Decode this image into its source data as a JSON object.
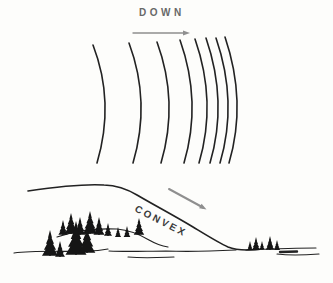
{
  "figure": {
    "top_label": "DOWN",
    "slope_label": "CONVEX"
  },
  "colors": {
    "background": "#fdfdfb",
    "ink": "#222222",
    "tree_fill": "#151515",
    "arrow_gray": "#8f8f8f",
    "down_label_color": "#686868",
    "convex_label_color": "#3a3a3a"
  },
  "drawing": {
    "contour_bottom_y": 163,
    "contours": [
      {
        "x": 93,
        "top": 45
      },
      {
        "x": 129,
        "top": 43
      },
      {
        "x": 157,
        "top": 42
      },
      {
        "x": 180,
        "top": 40
      },
      {
        "x": 195,
        "top": 39
      },
      {
        "x": 206,
        "top": 38
      },
      {
        "x": 216,
        "top": 38
      },
      {
        "x": 225,
        "top": 37
      }
    ],
    "arrows": {
      "down": {
        "x1": 133,
        "y1": 33,
        "x2": 186,
        "y2": 33,
        "width": 1.4
      },
      "slope": {
        "x1": 169,
        "y1": 189,
        "x2": 203,
        "y2": 207.5,
        "width": 2
      }
    },
    "profile_path": "M28,191 C55,187 88,184 104,185 C118,185.5 127,189 137,195 C154,205 173,215 193,227 C207,235.5 219,243 228,247 C234,249.5 240,250 247,250 C255,250 259,249.5 263,249",
    "terrain_strokes": [
      {
        "d": "M57,237 C74,231 96,228 117,229 C129,230 139,234 149,240 C156,244 162,246 168,247",
        "w": 1.2
      },
      {
        "d": "M14,253 C36,250 62,252 88,251 C97,251 103,250 108,249",
        "w": 1.2
      },
      {
        "d": "M109,251 C128,252 147,251 166,251 C192,252 216,251 236,250",
        "w": 1.1
      },
      {
        "d": "M128,257 C145,258.5 160,257.5 174,257",
        "w": 1.1
      },
      {
        "d": "M246,250 C270,249 293,248 316,248",
        "w": 1.1
      },
      {
        "d": "M277,254 C292,256 306,255 319,254",
        "w": 1.1
      },
      {
        "d": "M280,252 L297,251.5",
        "w": 2.4
      }
    ],
    "trees": {
      "left_back": [
        [
          63,
          235,
          15
        ],
        [
          71,
          234,
          21
        ],
        [
          80,
          235,
          18
        ],
        [
          90,
          234,
          23
        ],
        [
          99,
          235,
          18
        ],
        [
          108,
          236,
          13
        ],
        [
          118,
          237,
          10
        ],
        [
          127,
          237,
          11
        ],
        [
          139,
          235,
          17
        ]
      ],
      "left_front": [
        [
          50,
          256,
          26
        ],
        [
          60,
          257,
          16
        ],
        [
          76,
          255,
          34
        ],
        [
          87,
          253,
          27
        ]
      ],
      "right": [
        [
          250,
          250,
          9
        ],
        [
          256,
          250,
          13
        ],
        [
          262,
          249,
          8
        ],
        [
          270,
          250,
          14
        ],
        [
          277,
          250,
          10
        ]
      ]
    }
  }
}
